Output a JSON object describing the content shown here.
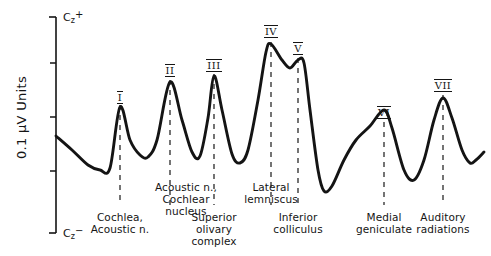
{
  "figure": {
    "y_axis": {
      "top_label_base": "C",
      "top_label_sub": "z",
      "top_label_sup": "+",
      "bottom_label_base": "C",
      "bottom_label_sub": "z",
      "bottom_label_sup": "−",
      "units_label": "0.1 μV Units",
      "tick_count": 5
    },
    "stroke_color": "#141414",
    "peaks": [
      {
        "numeral": "I",
        "caption": "Cochlea,\nAcoustic n.",
        "x": 120,
        "label_y": 92,
        "dash_top": 105,
        "dash_bottom": 205,
        "caption_x": 120,
        "caption_y": 212
      },
      {
        "numeral": "II",
        "caption": "Acoustic n.,\nCochlear\nnucleus",
        "x": 170,
        "label_y": 65,
        "dash_top": 80,
        "dash_bottom": 205,
        "caption_x": 186,
        "caption_y": 182
      },
      {
        "numeral": "III",
        "caption": "Superior\nolivary\ncomplex",
        "x": 214,
        "label_y": 60,
        "dash_top": 74,
        "dash_bottom": 205,
        "caption_x": 214,
        "caption_y": 212
      },
      {
        "numeral": "IV",
        "caption": "Lateral\nlemniscus",
        "x": 271,
        "label_y": 26,
        "dash_top": 42,
        "dash_bottom": 205,
        "caption_x": 271,
        "caption_y": 182
      },
      {
        "numeral": "V",
        "caption": "Inferior\ncolliculus",
        "x": 298,
        "label_y": 43,
        "dash_top": 58,
        "dash_bottom": 205,
        "caption_x": 298,
        "caption_y": 212
      },
      {
        "numeral": "VI",
        "caption": "Medial\ngeniculate",
        "x": 384,
        "label_y": 107,
        "dash_top": 122,
        "dash_bottom": 205,
        "caption_x": 384,
        "caption_y": 212
      },
      {
        "numeral": "VII",
        "caption": "Auditory\nradiations",
        "x": 443,
        "label_y": 80,
        "dash_top": 95,
        "dash_bottom": 205,
        "caption_x": 443,
        "caption_y": 212
      }
    ]
  },
  "chart_data": {
    "type": "line",
    "title": "",
    "xlabel": "",
    "ylabel": "0.1 μV Units",
    "ylim_labels": [
      "Cz−",
      "Cz+"
    ],
    "grid": false,
    "legend": null,
    "series": [
      {
        "name": "Auditory brainstem evoked response",
        "comment": "Waveform vertex coordinates in screenshot pixel space (y down).",
        "points": [
          [
            56,
            136
          ],
          [
            72,
            150
          ],
          [
            88,
            165
          ],
          [
            100,
            170
          ],
          [
            110,
            168
          ],
          [
            120,
            107
          ],
          [
            130,
            140
          ],
          [
            140,
            155
          ],
          [
            148,
            157
          ],
          [
            157,
            140
          ],
          [
            170,
            82
          ],
          [
            182,
            120
          ],
          [
            192,
            152
          ],
          [
            200,
            156
          ],
          [
            208,
            118
          ],
          [
            214,
            76
          ],
          [
            222,
            110
          ],
          [
            232,
            154
          ],
          [
            240,
            163
          ],
          [
            248,
            150
          ],
          [
            258,
            100
          ],
          [
            266,
            52
          ],
          [
            271,
            44
          ],
          [
            282,
            60
          ],
          [
            290,
            68
          ],
          [
            298,
            60
          ],
          [
            304,
            63
          ],
          [
            310,
            110
          ],
          [
            318,
            170
          ],
          [
            324,
            191
          ],
          [
            332,
            186
          ],
          [
            344,
            160
          ],
          [
            356,
            140
          ],
          [
            370,
            126
          ],
          [
            384,
            110
          ],
          [
            392,
            128
          ],
          [
            404,
            170
          ],
          [
            414,
            180
          ],
          [
            424,
            160
          ],
          [
            434,
            120
          ],
          [
            443,
            98
          ],
          [
            452,
            118
          ],
          [
            462,
            150
          ],
          [
            470,
            163
          ],
          [
            476,
            160
          ],
          [
            484,
            152
          ]
        ]
      }
    ]
  }
}
